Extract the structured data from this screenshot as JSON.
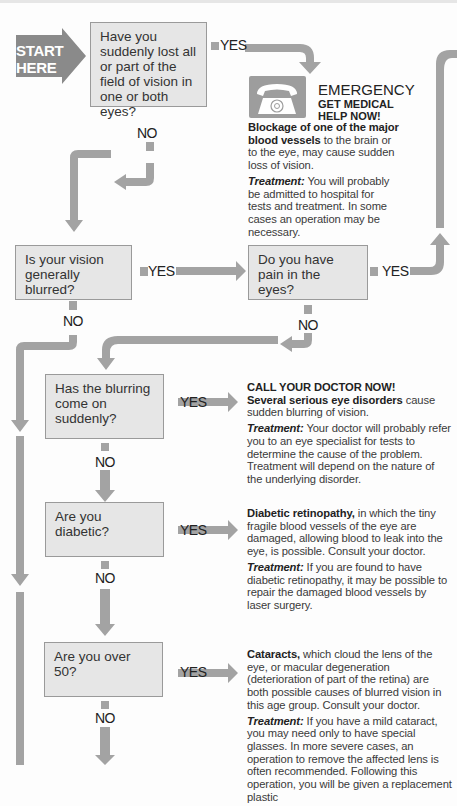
{
  "start_label_line1": "START",
  "start_label_line2": "HERE",
  "labels": {
    "yes": "YES",
    "no": "NO"
  },
  "questions": [
    {
      "id": "q1",
      "text": "Have you suddenly lost all or part of the field of vision in one or both eyes?"
    },
    {
      "id": "q2",
      "text": "Is your vision generally blurred?"
    },
    {
      "id": "q3",
      "text": "Do you have pain in the eyes?"
    },
    {
      "id": "q4",
      "text": "Has the blurring come on suddenly?"
    },
    {
      "id": "q5",
      "text": "Are you diabetic?"
    },
    {
      "id": "q6",
      "text": "Are you over 50?"
    }
  ],
  "emergency": {
    "icon": "telephone-icon",
    "title": "EMERGENCY",
    "subtitle_line1": "GET MEDICAL",
    "subtitle_line2": "HELP NOW!",
    "bold": "Blockage of one of the major blood vessels",
    "body": " to the brain or to the eye, may cause sudden loss of vision.",
    "treatment_label": "Treatment:",
    "treatment": " You will probably be admitted to hospital for tests and treatment. In some cases an operation may be necessary."
  },
  "outcome_blurring": {
    "heading": "CALL YOUR DOCTOR NOW!",
    "bold": "Several serious eye disorders",
    "body": " cause sudden blurring of vision.",
    "treatment_label": "Treatment:",
    "treatment": " Your doctor will probably refer you to an eye specialist for tests to determine the cause of the problem. Treatment will depend on the nature of the underlying disorder."
  },
  "outcome_diabetic": {
    "bold": "Diabetic retinopathy,",
    "body": " in which the tiny fragile blood vessels of the eye are damaged, allowing blood to leak into the eye, is possible. Consult your doctor.",
    "treatment_label": "Treatment:",
    "treatment": " If you are found to have diabetic retinopathy, it may be possible to repair the damaged blood vessels by laser surgery."
  },
  "outcome_over50": {
    "bold": "Cataracts,",
    "body": " which cloud the lens of the eye, or macular degeneration (deterioration of part of the retina) are both possible causes of blurred vision in this age group. Consult your doctor.",
    "treatment_label": "Treatment:",
    "treatment": " If you have a mild cataract, you may need only to have special glasses. In more severe cases, an operation to remove the affected lens is often recommended. Following this operation, you will be given a replacement plastic"
  },
  "colors": {
    "arrow": "#a3a3a3",
    "box_fill": "#e6e6e6",
    "box_border": "#9a9a9a",
    "start_fill": "#8a8a8a"
  }
}
